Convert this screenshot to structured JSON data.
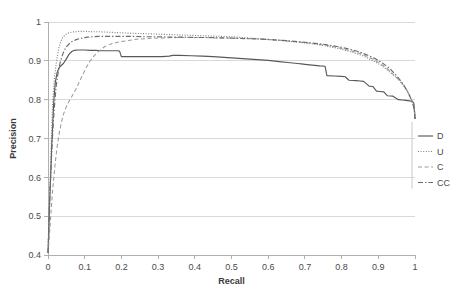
{
  "chart_data": {
    "type": "line",
    "title": "",
    "xlabel": "Recall",
    "ylabel": "Precision",
    "xlim": [
      0,
      1
    ],
    "ylim": [
      0.4,
      1
    ],
    "grid": true,
    "legend_position": "right",
    "xticks": [
      "0",
      "0.1",
      "0.2",
      "0.3",
      "0.4",
      "0.5",
      "0.6",
      "0.7",
      "0.8",
      "0.9",
      "1"
    ],
    "xtick_values": [
      0,
      0.1,
      0.2,
      0.3,
      0.4,
      0.5,
      0.6,
      0.7,
      0.8,
      0.9,
      1
    ],
    "yticks": [
      "0.4",
      "0.5",
      "0.6",
      "0.7",
      "0.8",
      "0.9",
      "1"
    ],
    "ytick_values": [
      0.4,
      0.5,
      0.6,
      0.7,
      0.8,
      0.9,
      1
    ],
    "series": [
      {
        "name": "D",
        "style": "solid",
        "color": "#595959",
        "x": [
          0.0,
          0.002,
          0.004,
          0.006,
          0.008,
          0.01,
          0.013,
          0.016,
          0.02,
          0.025,
          0.03,
          0.036,
          0.042,
          0.05,
          0.058,
          0.065,
          0.072,
          0.08,
          0.09,
          0.1,
          0.115,
          0.13,
          0.145,
          0.16,
          0.175,
          0.19,
          0.195,
          0.2,
          0.22,
          0.25,
          0.28,
          0.31,
          0.33,
          0.34,
          0.36,
          0.39,
          0.42,
          0.45,
          0.48,
          0.51,
          0.54,
          0.57,
          0.6,
          0.63,
          0.66,
          0.68,
          0.69,
          0.7,
          0.72,
          0.74,
          0.755,
          0.76,
          0.78,
          0.8,
          0.81,
          0.82,
          0.84,
          0.85,
          0.86,
          0.875,
          0.885,
          0.895,
          0.905,
          0.915,
          0.925,
          0.94,
          0.955,
          0.965,
          0.975,
          0.985,
          0.993,
          0.997,
          1.0
        ],
        "y": [
          0.405,
          0.45,
          0.52,
          0.57,
          0.62,
          0.68,
          0.74,
          0.8,
          0.845,
          0.87,
          0.882,
          0.888,
          0.893,
          0.905,
          0.918,
          0.924,
          0.927,
          0.928,
          0.928,
          0.928,
          0.927,
          0.927,
          0.926,
          0.926,
          0.926,
          0.926,
          0.925,
          0.911,
          0.911,
          0.911,
          0.911,
          0.911,
          0.912,
          0.914,
          0.914,
          0.913,
          0.912,
          0.911,
          0.909,
          0.907,
          0.905,
          0.903,
          0.901,
          0.898,
          0.895,
          0.893,
          0.892,
          0.891,
          0.889,
          0.887,
          0.886,
          0.862,
          0.861,
          0.86,
          0.859,
          0.85,
          0.849,
          0.848,
          0.847,
          0.835,
          0.834,
          0.822,
          0.821,
          0.82,
          0.81,
          0.809,
          0.8,
          0.799,
          0.798,
          0.797,
          0.796,
          0.79,
          0.75
        ]
      },
      {
        "name": "U",
        "style": "dotted",
        "color": "#7f7f7f",
        "x": [
          0.0,
          0.002,
          0.004,
          0.006,
          0.008,
          0.01,
          0.012,
          0.015,
          0.018,
          0.022,
          0.026,
          0.03,
          0.035,
          0.04,
          0.048,
          0.056,
          0.065,
          0.075,
          0.085,
          0.1,
          0.12,
          0.14,
          0.16,
          0.18,
          0.2,
          0.23,
          0.26,
          0.29,
          0.32,
          0.35,
          0.38,
          0.41,
          0.44,
          0.47,
          0.5,
          0.53,
          0.56,
          0.59,
          0.62,
          0.65,
          0.68,
          0.71,
          0.74,
          0.77,
          0.8,
          0.83,
          0.855,
          0.88,
          0.9,
          0.92,
          0.94,
          0.955,
          0.968,
          0.978,
          0.986,
          0.992,
          0.996,
          0.999,
          1.0
        ],
        "y": [
          0.405,
          0.48,
          0.545,
          0.6,
          0.66,
          0.72,
          0.775,
          0.825,
          0.86,
          0.89,
          0.915,
          0.935,
          0.95,
          0.96,
          0.968,
          0.972,
          0.974,
          0.975,
          0.976,
          0.976,
          0.975,
          0.975,
          0.974,
          0.973,
          0.972,
          0.971,
          0.97,
          0.969,
          0.968,
          0.967,
          0.966,
          0.965,
          0.964,
          0.963,
          0.962,
          0.96,
          0.958,
          0.956,
          0.954,
          0.951,
          0.948,
          0.945,
          0.941,
          0.936,
          0.93,
          0.922,
          0.914,
          0.903,
          0.893,
          0.88,
          0.864,
          0.852,
          0.838,
          0.824,
          0.81,
          0.796,
          0.784,
          0.77,
          0.75
        ]
      },
      {
        "name": "C",
        "style": "dashed",
        "color": "#9a9a9a",
        "x": [
          0.0,
          0.003,
          0.006,
          0.009,
          0.012,
          0.016,
          0.02,
          0.025,
          0.03,
          0.036,
          0.042,
          0.05,
          0.058,
          0.066,
          0.075,
          0.085,
          0.095,
          0.105,
          0.115,
          0.125,
          0.135,
          0.145,
          0.155,
          0.17,
          0.19,
          0.215,
          0.245,
          0.28,
          0.315,
          0.35,
          0.385,
          0.42,
          0.455,
          0.49,
          0.525,
          0.56,
          0.595,
          0.63,
          0.665,
          0.7,
          0.735,
          0.77,
          0.8,
          0.83,
          0.858,
          0.882,
          0.903,
          0.922,
          0.94,
          0.955,
          0.968,
          0.978,
          0.986,
          0.992,
          0.996,
          0.999,
          1.0
        ],
        "y": [
          0.405,
          0.44,
          0.48,
          0.52,
          0.56,
          0.6,
          0.64,
          0.68,
          0.71,
          0.74,
          0.762,
          0.782,
          0.797,
          0.81,
          0.825,
          0.845,
          0.865,
          0.884,
          0.9,
          0.912,
          0.922,
          0.93,
          0.937,
          0.943,
          0.948,
          0.952,
          0.956,
          0.958,
          0.959,
          0.96,
          0.96,
          0.96,
          0.959,
          0.959,
          0.958,
          0.957,
          0.955,
          0.953,
          0.95,
          0.947,
          0.943,
          0.938,
          0.932,
          0.925,
          0.916,
          0.906,
          0.895,
          0.882,
          0.866,
          0.852,
          0.838,
          0.824,
          0.81,
          0.796,
          0.784,
          0.77,
          0.75
        ]
      },
      {
        "name": "CC",
        "style": "dashdot",
        "color": "#6b6b6b",
        "x": [
          0.0,
          0.002,
          0.004,
          0.006,
          0.009,
          0.012,
          0.015,
          0.019,
          0.023,
          0.028,
          0.033,
          0.038,
          0.044,
          0.05,
          0.058,
          0.066,
          0.075,
          0.085,
          0.095,
          0.108,
          0.122,
          0.138,
          0.155,
          0.175,
          0.2,
          0.23,
          0.265,
          0.3,
          0.335,
          0.37,
          0.405,
          0.44,
          0.475,
          0.51,
          0.545,
          0.58,
          0.615,
          0.65,
          0.685,
          0.72,
          0.755,
          0.788,
          0.818,
          0.845,
          0.87,
          0.893,
          0.912,
          0.93,
          0.946,
          0.96,
          0.971,
          0.98,
          0.987,
          0.993,
          0.997,
          0.999,
          1.0
        ],
        "y": [
          0.405,
          0.47,
          0.53,
          0.58,
          0.64,
          0.7,
          0.75,
          0.8,
          0.84,
          0.872,
          0.895,
          0.912,
          0.926,
          0.936,
          0.944,
          0.95,
          0.954,
          0.957,
          0.959,
          0.961,
          0.962,
          0.963,
          0.963,
          0.963,
          0.963,
          0.963,
          0.962,
          0.962,
          0.961,
          0.961,
          0.96,
          0.96,
          0.959,
          0.958,
          0.957,
          0.956,
          0.954,
          0.952,
          0.949,
          0.946,
          0.942,
          0.937,
          0.931,
          0.924,
          0.915,
          0.905,
          0.894,
          0.881,
          0.866,
          0.85,
          0.835,
          0.82,
          0.806,
          0.792,
          0.78,
          0.768,
          0.75
        ]
      }
    ]
  },
  "legend": {
    "items": [
      {
        "label": "D",
        "style": "solid"
      },
      {
        "label": "U",
        "style": "dotted"
      },
      {
        "label": "C",
        "style": "dashed"
      },
      {
        "label": "CC",
        "style": "dashdot"
      }
    ]
  }
}
